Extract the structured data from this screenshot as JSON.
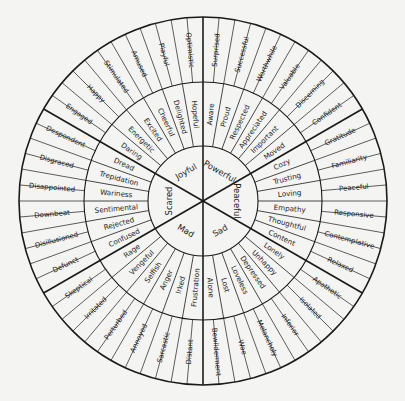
{
  "diagram": {
    "type": "feelings-wheel",
    "center": [
      203,
      201
    ],
    "radii": {
      "outer": 184,
      "middle": 119,
      "inner": 55
    },
    "line_color": "#1a1a1a",
    "background": "#f4f4f2"
  },
  "sectors": [
    {
      "core": "Joyful",
      "middle": [
        "Daring",
        "Energetic",
        "Excited",
        "Cheerful",
        "Delighted",
        "Hopeful"
      ],
      "outer": [
        "Engaged",
        "Happy",
        "Stimulated",
        "Amused",
        "Playful",
        "Optimistic"
      ]
    },
    {
      "core": "Powerful",
      "middle": [
        "Aware",
        "Proud",
        "Respected",
        "Appreciated",
        "Important",
        "Moved"
      ],
      "outer": [
        "Surprised",
        "Successful",
        "Worthwhile",
        "Valuable",
        "Discerning",
        "Confident"
      ]
    },
    {
      "core": "Peaceful",
      "middle": [
        "Cozy",
        "Trusting",
        "Loving",
        "Empathy",
        "Thoughtful",
        "Content"
      ],
      "outer": [
        "Gratitude",
        "Familiarity",
        "Peaceful",
        "Responsive",
        "Contemplative",
        "Relaxed"
      ]
    },
    {
      "core": "Sad",
      "middle": [
        "Lonely",
        "Unhappy",
        "Depressed",
        "Loveless",
        "Lost",
        "Alone"
      ],
      "outer": [
        "Apathetic",
        "Isolated",
        "Inferior",
        "Melancholy",
        "Woe",
        "Bewilderment"
      ]
    },
    {
      "core": "Mad",
      "middle": [
        "Frustration",
        "Irked",
        "Anger",
        "Selfish",
        "Vengeful",
        "Rage"
      ],
      "outer": [
        "Distant",
        "Sarcastic",
        "Annoyed",
        "Perturbed",
        "Irritated",
        "Skeptical"
      ]
    },
    {
      "core": "Scared",
      "middle": [
        "Confused",
        "Rejected",
        "Sentimental",
        "Wariness",
        "Trepidation",
        "Dread"
      ],
      "outer": [
        "Defunct",
        "Disillusioned",
        "Downbeat",
        "Disappointed",
        "Disgraced",
        "Despondent"
      ]
    }
  ]
}
